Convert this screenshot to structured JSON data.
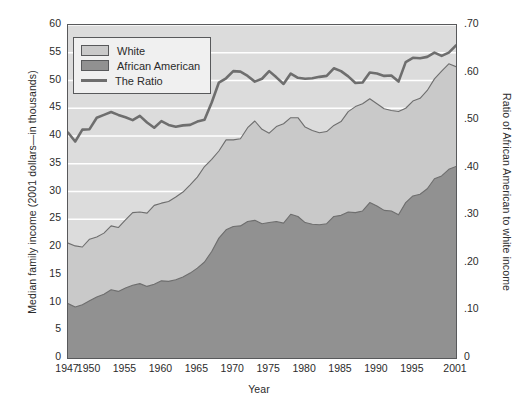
{
  "chart_data": {
    "type": "area",
    "title": "",
    "subtitle": "",
    "xlabel": "Year",
    "ylabel": "Median family income (2001 dollars—in thousands)",
    "y2label": "Ratio of African American to white income",
    "xlim": [
      1947,
      2001
    ],
    "ylim": [
      0,
      60
    ],
    "y2lim": [
      0,
      0.7
    ],
    "grid": "horizontal",
    "legend_position": "top-left",
    "xticks": [
      "1947",
      "1950",
      "1955",
      "1960",
      "1965",
      "1970",
      "1975",
      "1980",
      "1985",
      "1990",
      "1995",
      "2001"
    ],
    "xtick_values": [
      1947,
      1950,
      1955,
      1960,
      1965,
      1970,
      1975,
      1980,
      1985,
      1990,
      1995,
      2001
    ],
    "yticks_left": [
      "0",
      "5",
      "10",
      "15",
      "20",
      "25",
      "30",
      "35",
      "40",
      "45",
      "50",
      "55",
      "60"
    ],
    "ytick_left_values": [
      0,
      5,
      10,
      15,
      20,
      25,
      30,
      35,
      40,
      45,
      50,
      55,
      60
    ],
    "yticks_right": [
      "0",
      ".10",
      ".20",
      ".30",
      ".40",
      ".50",
      ".60",
      ".70"
    ],
    "ytick_right_values": [
      0,
      0.1,
      0.2,
      0.3,
      0.4,
      0.5,
      0.6,
      0.7
    ],
    "colors": {
      "white_area": "#c9c9c9",
      "african_american_area": "#919191",
      "ratio_line": "#6e6e6e",
      "plot_background": "#dcdcdc",
      "gridline": "#ffffff",
      "axis": "#58595b",
      "legend_background": "#f0f0f0",
      "text": "#2b2b2b"
    },
    "x": [
      1947,
      1948,
      1949,
      1950,
      1951,
      1952,
      1953,
      1954,
      1955,
      1956,
      1957,
      1958,
      1959,
      1960,
      1961,
      1962,
      1963,
      1964,
      1965,
      1966,
      1967,
      1968,
      1969,
      1970,
      1971,
      1972,
      1973,
      1974,
      1975,
      1976,
      1977,
      1978,
      1979,
      1980,
      1981,
      1982,
      1983,
      1984,
      1985,
      1986,
      1987,
      1988,
      1989,
      1990,
      1991,
      1992,
      1993,
      1994,
      1995,
      1996,
      1997,
      1998,
      1999,
      2000,
      2001
    ],
    "series": [
      {
        "name": "White",
        "stacking": "overlay-top",
        "axis": "left",
        "values": [
          20.7,
          20.2,
          20.0,
          21.4,
          21.8,
          22.5,
          23.8,
          23.5,
          24.9,
          26.2,
          26.3,
          26.1,
          27.5,
          27.9,
          28.2,
          29.0,
          29.9,
          31.2,
          32.6,
          34.5,
          35.8,
          37.3,
          39.3,
          39.3,
          39.5,
          41.5,
          42.7,
          41.2,
          40.5,
          41.7,
          42.2,
          43.3,
          43.3,
          41.6,
          41.0,
          40.6,
          40.8,
          41.9,
          42.6,
          44.4,
          45.3,
          45.8,
          46.7,
          45.8,
          44.9,
          44.6,
          44.4,
          45.0,
          46.3,
          46.8,
          48.2,
          50.3,
          51.7,
          53.0,
          52.5
        ]
      },
      {
        "name": "African American",
        "stacking": "overlay-front",
        "axis": "left",
        "values": [
          9.8,
          9.2,
          9.6,
          10.3,
          11.0,
          11.5,
          12.3,
          12.0,
          12.6,
          13.1,
          13.4,
          12.9,
          13.3,
          13.9,
          13.8,
          14.1,
          14.6,
          15.3,
          16.2,
          17.3,
          19.2,
          21.6,
          23.1,
          23.7,
          23.8,
          24.6,
          24.8,
          24.2,
          24.4,
          24.6,
          24.3,
          25.9,
          25.5,
          24.4,
          24.1,
          24.0,
          24.2,
          25.5,
          25.7,
          26.3,
          26.2,
          26.5,
          28.0,
          27.4,
          26.6,
          26.5,
          25.8,
          28.0,
          29.2,
          29.5,
          30.5,
          32.3,
          32.8,
          34.0,
          34.5
        ]
      },
      {
        "name": "The Ratio",
        "axis": "right",
        "values": [
          0.474,
          0.455,
          0.48,
          0.481,
          0.505,
          0.511,
          0.517,
          0.511,
          0.506,
          0.5,
          0.509,
          0.495,
          0.484,
          0.498,
          0.49,
          0.486,
          0.489,
          0.49,
          0.497,
          0.501,
          0.537,
          0.579,
          0.588,
          0.603,
          0.602,
          0.593,
          0.581,
          0.587,
          0.603,
          0.59,
          0.576,
          0.598,
          0.589,
          0.587,
          0.588,
          0.591,
          0.593,
          0.609,
          0.603,
          0.592,
          0.578,
          0.579,
          0.6,
          0.598,
          0.593,
          0.594,
          0.581,
          0.622,
          0.631,
          0.63,
          0.633,
          0.642,
          0.635,
          0.642,
          0.657
        ]
      }
    ]
  },
  "legend": {
    "items": [
      {
        "label": "White",
        "marker": "swatch-light-gray"
      },
      {
        "label": "African American",
        "marker": "swatch-dark-gray"
      },
      {
        "label": "The Ratio",
        "marker": "line-gray"
      }
    ]
  }
}
